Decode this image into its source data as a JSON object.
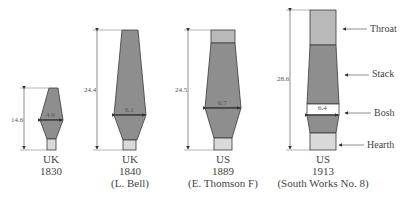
{
  "diagram": {
    "colors": {
      "stack": "#8e8e8e",
      "throat": "#b9b9b9",
      "hearth": "#d9d9d9",
      "outline": "#3a3a3a",
      "dimension": "#444444"
    },
    "furnaces": [
      {
        "country": "UK",
        "year": "1830",
        "note": "",
        "height": "14.6",
        "bosh_width": "4.9"
      },
      {
        "country": "UK",
        "year": "1840",
        "note": "(L. Bell)",
        "height": "24.4",
        "bosh_width": "6.1"
      },
      {
        "country": "US",
        "year": "1889",
        "note": "(E. Thomson F)",
        "height": "24.5",
        "bosh_width": "6.7"
      },
      {
        "country": "US",
        "year": "1913",
        "note": "(South Works No. 8)",
        "height": "28.6",
        "bosh_width": "6.4"
      }
    ],
    "parts": [
      "Throat",
      "Stack",
      "Bosh",
      "Hearth"
    ]
  }
}
